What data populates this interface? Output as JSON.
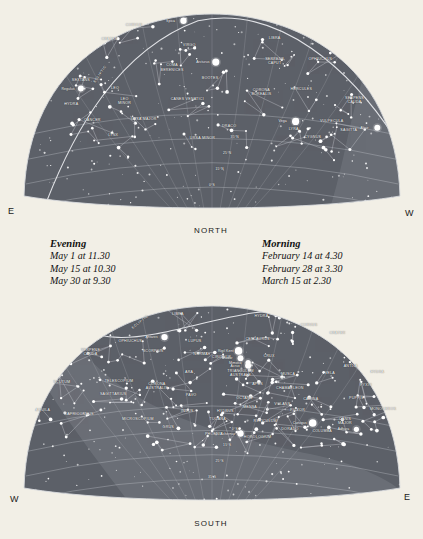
{
  "page": {
    "background_color": "#f2efe6",
    "sky_color": "#5c6068",
    "sky_color_dark": "#4a4e56",
    "milkyway_color": "#7e828a",
    "star_color": "#ffffff",
    "line_color": "#b9bcc2",
    "label_color": "#ffffff"
  },
  "north_chart": {
    "name": "northern-sky-chart",
    "cardinal_bottom": "NORTH",
    "edge_left": "E",
    "edge_right": "W",
    "ecliptic_label": "ECLIPTIC",
    "declination_labels": [
      "35°N",
      "25°N",
      "15°N",
      "0°S"
    ],
    "constellations": [
      {
        "label": "CORVUS",
        "x": 29.5,
        "y": 8.0
      },
      {
        "label": "CRATER",
        "x": 23.0,
        "y": 14.5
      },
      {
        "label": "VIRGO",
        "x": 44.0,
        "y": 17.5
      },
      {
        "label": "LIBRA",
        "x": 66.5,
        "y": 14.0
      },
      {
        "label": "OPHIUCHUS",
        "x": 78.5,
        "y": 24.0
      },
      {
        "label": "SERPENS\nCAPUT",
        "x": 66.5,
        "y": 25.0
      },
      {
        "label": "COMA\nBERENICES",
        "x": 39.5,
        "y": 28.0
      },
      {
        "label": "BOÖTES",
        "x": 49.5,
        "y": 33.0
      },
      {
        "label": "SEXTANS",
        "x": 15.5,
        "y": 34.0
      },
      {
        "label": "LEO",
        "x": 24.5,
        "y": 37.5
      },
      {
        "label": "CORONA\nBOREALIS",
        "x": 63.0,
        "y": 39.5
      },
      {
        "label": "HERCULES",
        "x": 73.5,
        "y": 38.0
      },
      {
        "label": "SERPENS\nCAUDA",
        "x": 87.5,
        "y": 43.5
      },
      {
        "label": "LEO\nMINOR",
        "x": 27.0,
        "y": 44.0
      },
      {
        "label": "CANES VENATICI",
        "x": 43.5,
        "y": 43.0
      },
      {
        "label": "HYDRA",
        "x": 13.0,
        "y": 45.5
      },
      {
        "label": "CANCER",
        "x": 18.5,
        "y": 53.0
      },
      {
        "label": "URSA MAJOR",
        "x": 32.0,
        "y": 52.5
      },
      {
        "label": "DRACO",
        "x": 54.5,
        "y": 55.5
      },
      {
        "label": "LYRA",
        "x": 71.5,
        "y": 57.0
      },
      {
        "label": "VULPECULA",
        "x": 81.5,
        "y": 53.5
      },
      {
        "label": "SAGITTA",
        "x": 86.0,
        "y": 57.5
      },
      {
        "label": "LYNX",
        "x": 24.0,
        "y": 60.0
      },
      {
        "label": "URSA MINOR",
        "x": 47.5,
        "y": 61.5
      },
      {
        "label": "CYGNUS",
        "x": 76.5,
        "y": 61.0
      }
    ],
    "named_stars": [
      {
        "label": "Spica",
        "x": 42.5,
        "y": 6.0,
        "mag": 3.2
      },
      {
        "label": "Arcturus",
        "x": 51.0,
        "y": 25.5,
        "mag": 3.6
      },
      {
        "label": "Regulus",
        "x": 15.5,
        "y": 38.0,
        "mag": 3.0
      },
      {
        "label": "Vega",
        "x": 72.0,
        "y": 53.5,
        "mag": 3.6
      },
      {
        "label": "Altair",
        "x": 93.5,
        "y": 56.5,
        "mag": 3.0
      }
    ]
  },
  "south_chart": {
    "name": "southern-sky-chart",
    "cardinal_bottom": "SOUTH",
    "edge_left": "W",
    "edge_right": "E",
    "ecliptic_label": "ECLIPTIC",
    "declination_labels": [
      "0°S",
      "15°S",
      "25°S",
      "35°S"
    ],
    "constellations": [
      {
        "label": "LIBRA",
        "x": 41.0,
        "y": 6.5
      },
      {
        "label": "HYDRA",
        "x": 63.0,
        "y": 7.5
      },
      {
        "label": "CORVUS",
        "x": 75.5,
        "y": 12.0
      },
      {
        "label": "CRATER",
        "x": 83.0,
        "y": 15.5
      },
      {
        "label": "OPHIUCHUS",
        "x": 28.5,
        "y": 19.5
      },
      {
        "label": "LUPUS",
        "x": 45.5,
        "y": 19.5
      },
      {
        "label": "CENTAURUS",
        "x": 62.0,
        "y": 18.5
      },
      {
        "label": "SERPENS\nCAUDA",
        "x": 18.0,
        "y": 24.5
      },
      {
        "label": "SCORPIUS",
        "x": 34.5,
        "y": 24.0
      },
      {
        "label": "NORMA",
        "x": 47.0,
        "y": 25.5
      },
      {
        "label": "CIRCINUS",
        "x": 52.5,
        "y": 27.0
      },
      {
        "label": "CRUX",
        "x": 65.0,
        "y": 26.5
      },
      {
        "label": "ANTLIA",
        "x": 86.5,
        "y": 31.0
      },
      {
        "label": "ARA",
        "x": 44.0,
        "y": 34.0
      },
      {
        "label": "TRIANGULUM\nAUSTRALE",
        "x": 57.5,
        "y": 34.5
      },
      {
        "label": "MUSCA",
        "x": 70.0,
        "y": 35.0
      },
      {
        "label": "VELA",
        "x": 81.0,
        "y": 34.5
      },
      {
        "label": "HYDRA",
        "x": 93.5,
        "y": 34.0
      },
      {
        "label": "SCUTUM",
        "x": 10.5,
        "y": 38.5
      },
      {
        "label": "TELESCOPIUM",
        "x": 25.5,
        "y": 38.0
      },
      {
        "label": "CORONA\nAUSTRALIS",
        "x": 35.5,
        "y": 40.5
      },
      {
        "label": "APUS",
        "x": 62.0,
        "y": 39.5
      },
      {
        "label": "CHAMAELEON",
        "x": 70.5,
        "y": 41.5
      },
      {
        "label": "PYXIS",
        "x": 90.5,
        "y": 40.0
      },
      {
        "label": "SAGITTARIUS",
        "x": 24.0,
        "y": 44.5
      },
      {
        "label": "PAVO",
        "x": 44.5,
        "y": 45.0
      },
      {
        "label": "OCTANS",
        "x": 58.5,
        "y": 46.0
      },
      {
        "label": "CARINA",
        "x": 76.0,
        "y": 46.5
      },
      {
        "label": "PUPPIS",
        "x": 88.0,
        "y": 46.0
      },
      {
        "label": "VOLANS",
        "x": 68.5,
        "y": 49.0
      },
      {
        "label": "MENSA",
        "x": 60.0,
        "y": 50.5
      },
      {
        "label": "AQUILA",
        "x": 5.5,
        "y": 52.0
      },
      {
        "label": "CAPRICORNUS",
        "x": 15.0,
        "y": 54.0
      },
      {
        "label": "INDUS",
        "x": 43.5,
        "y": 52.5
      },
      {
        "label": "HYDRUS",
        "x": 53.5,
        "y": 52.5
      },
      {
        "label": "PICTOR",
        "x": 72.5,
        "y": 52.0
      },
      {
        "label": "MONOCEROS",
        "x": 95.0,
        "y": 51.5
      },
      {
        "label": "MICROSCOPIUM",
        "x": 30.5,
        "y": 56.0
      },
      {
        "label": "TUCANA",
        "x": 51.5,
        "y": 56.0
      },
      {
        "label": "RETICULUM",
        "x": 64.0,
        "y": 57.0
      },
      {
        "label": "CANIS\nMAJOR",
        "x": 85.0,
        "y": 57.0
      },
      {
        "label": "GRUS",
        "x": 38.5,
        "y": 60.0
      },
      {
        "label": "DORADO",
        "x": 70.5,
        "y": 61.0
      },
      {
        "label": "COLUMBA",
        "x": 79.0,
        "y": 62.0
      },
      {
        "label": "PHOENIX",
        "x": 50.5,
        "y": 63.0
      },
      {
        "label": "HOROLOGIUM",
        "x": 62.0,
        "y": 64.5
      }
    ],
    "named_stars": [
      {
        "label": "Antares",
        "x": 37.5,
        "y": 17.5,
        "mag": 3.2
      },
      {
        "label": "Rigil Kent",
        "x": 57.0,
        "y": 24.0,
        "mag": 3.8
      },
      {
        "label": "Hadar",
        "x": 57.5,
        "y": 27.5,
        "mag": 3.0
      },
      {
        "label": "Mimosa",
        "x": 59.5,
        "y": 29.5,
        "mag": 2.6
      },
      {
        "label": "Acrux",
        "x": 59.5,
        "y": 31.0,
        "mag": 3.0
      },
      {
        "label": "Canopus",
        "x": 76.5,
        "y": 58.0,
        "mag": 3.8
      },
      {
        "label": "Adhara",
        "x": 88.0,
        "y": 61.0,
        "mag": 2.6
      },
      {
        "label": "Achernar",
        "x": 57.5,
        "y": 63.0,
        "mag": 3.2
      }
    ]
  },
  "legend_evening": {
    "heading": "Evening",
    "lines": [
      "May 1 at 11.30",
      "May 15 at 10.30",
      "May 30 at 9.30"
    ]
  },
  "legend_morning": {
    "heading": "Morning",
    "lines": [
      "February 14 at 4.30",
      "February 28 at 3.30",
      "March 15 at 2.30"
    ]
  }
}
